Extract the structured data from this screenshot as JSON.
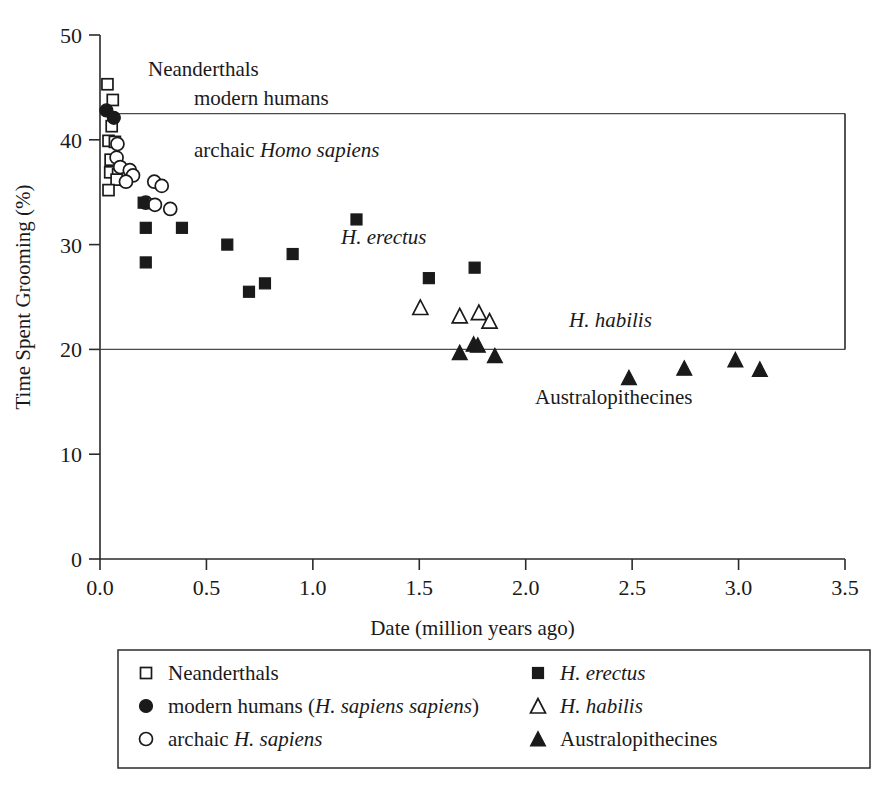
{
  "chart_data": {
    "type": "scatter",
    "title": "",
    "xlabel": "Date (million years ago)",
    "ylabel": "Time Spent Grooming (%)",
    "xlim": [
      0.0,
      3.5
    ],
    "ylim": [
      0,
      50
    ],
    "xticks": [
      "0.0",
      "0.5",
      "1.0",
      "1.5",
      "2.0",
      "2.5",
      "3.0",
      "3.5"
    ],
    "xtick_values": [
      0.0,
      0.5,
      1.0,
      1.5,
      2.0,
      2.5,
      3.0,
      3.5
    ],
    "yticks": [
      "0",
      "10",
      "20",
      "30",
      "40",
      "50"
    ],
    "ytick_values": [
      0,
      10,
      20,
      30,
      40,
      50
    ],
    "grid": false,
    "reference_lines": [
      42.5,
      20.0
    ],
    "legend_position": "below-plot",
    "series": [
      {
        "name": "Neanderthals",
        "marker": "open-square",
        "points": [
          [
            0.035,
            45.3
          ],
          [
            0.06,
            43.8
          ],
          [
            0.055,
            41.3
          ],
          [
            0.04,
            39.9
          ],
          [
            0.07,
            39.8
          ],
          [
            0.05,
            38.1
          ],
          [
            0.048,
            36.9
          ],
          [
            0.085,
            36.7
          ],
          [
            0.112,
            36.9
          ],
          [
            0.078,
            36.2
          ],
          [
            0.04,
            35.2
          ]
        ]
      },
      {
        "name": "modern humans (H. sapiens sapiens)",
        "marker": "filled-circle",
        "points": [
          [
            0.03,
            42.8
          ],
          [
            0.065,
            42.1
          ]
        ]
      },
      {
        "name": "archaic H. sapiens",
        "marker": "open-circle",
        "points": [
          [
            0.082,
            39.6
          ],
          [
            0.078,
            38.3
          ],
          [
            0.095,
            37.4
          ],
          [
            0.14,
            37.1
          ],
          [
            0.155,
            36.6
          ],
          [
            0.122,
            36.0
          ],
          [
            0.255,
            36.0
          ],
          [
            0.29,
            35.6
          ],
          [
            0.215,
            34.0
          ],
          [
            0.258,
            33.8
          ],
          [
            0.33,
            33.4
          ]
        ]
      },
      {
        "name": "H. erectus",
        "marker": "filled-square",
        "points": [
          [
            0.205,
            34.0
          ],
          [
            0.215,
            31.6
          ],
          [
            0.385,
            31.6
          ],
          [
            0.215,
            28.3
          ],
          [
            0.598,
            30.0
          ],
          [
            0.905,
            29.1
          ],
          [
            1.205,
            32.4
          ],
          [
            0.7,
            25.5
          ],
          [
            0.775,
            26.3
          ],
          [
            1.545,
            26.8
          ],
          [
            1.76,
            27.8
          ]
        ]
      },
      {
        "name": "H. habilis",
        "marker": "open-triangle",
        "points": [
          [
            1.505,
            24.0
          ],
          [
            1.69,
            23.2
          ],
          [
            1.78,
            23.5
          ],
          [
            1.83,
            22.7
          ]
        ]
      },
      {
        "name": "Australopithecines",
        "marker": "filled-triangle",
        "points": [
          [
            1.69,
            19.7
          ],
          [
            1.755,
            20.5
          ],
          [
            1.775,
            20.4
          ],
          [
            1.855,
            19.4
          ],
          [
            2.485,
            17.3
          ],
          [
            2.745,
            18.2
          ],
          [
            2.985,
            19.0
          ],
          [
            3.1,
            18.1
          ]
        ]
      }
    ],
    "annotations": [
      {
        "text": "Neanderthals",
        "x_px": 148,
        "y_px": 76,
        "italic": false
      },
      {
        "text": "modern humans",
        "x_px": 194,
        "y_px": 105,
        "italic": false
      },
      {
        "text": "archaic ",
        "x_px": 194,
        "y_px": 157,
        "italic": false,
        "italic_suffix": "Homo sapiens"
      },
      {
        "text": "H. erectus",
        "x_px": 341,
        "y_px": 244,
        "italic": true
      },
      {
        "text": "H. habilis",
        "x_px": 569,
        "y_px": 327,
        "italic": true
      },
      {
        "text": "Australopithecines",
        "x_px": 535,
        "y_px": 404,
        "italic": false
      }
    ]
  },
  "legend": {
    "column_left": [
      {
        "marker": "open-square",
        "label": "Neanderthals",
        "italic_part": ""
      },
      {
        "marker": "filled-circle",
        "label": "modern humans (",
        "italic_part": "H. sapiens sapiens",
        "label_tail": ")"
      },
      {
        "marker": "open-circle",
        "label": "archaic ",
        "italic_part": "H. sapiens",
        "label_tail": ""
      }
    ],
    "column_right": [
      {
        "marker": "filled-square",
        "label": "",
        "italic_part": "H. erectus",
        "label_tail": ""
      },
      {
        "marker": "open-triangle",
        "label": "",
        "italic_part": "H. habilis",
        "label_tail": ""
      },
      {
        "marker": "filled-triangle",
        "label": "Australopithecines",
        "italic_part": "",
        "label_tail": ""
      }
    ]
  }
}
